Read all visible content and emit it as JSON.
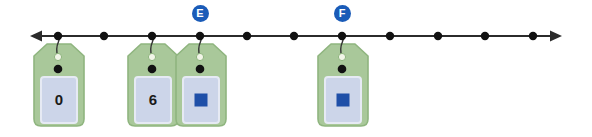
{
  "figure": {
    "background_color": "#ffffff"
  },
  "number_line": {
    "name": "horizontal-number-line",
    "y": 36,
    "x_start": 30,
    "x_end": 562,
    "line_color": "#2b2b2b",
    "line_width": 2.2,
    "arrow_left": true,
    "arrow_right": true,
    "point_color": "#111111",
    "point_radius": 4.2,
    "points": [
      {
        "id": "p1",
        "x": 58,
        "has_tag": true,
        "badge": null
      },
      {
        "id": "p2",
        "x": 104,
        "has_tag": false,
        "badge": null
      },
      {
        "id": "p3",
        "x": 152,
        "has_tag": true,
        "badge": null
      },
      {
        "id": "p4",
        "x": 200,
        "has_tag": true,
        "badge": "E"
      },
      {
        "id": "p5",
        "x": 247,
        "has_tag": false,
        "badge": null
      },
      {
        "id": "p6",
        "x": 294,
        "has_tag": false,
        "badge": null
      },
      {
        "id": "p7",
        "x": 342,
        "has_tag": true,
        "badge": "F"
      },
      {
        "id": "p8",
        "x": 390,
        "has_tag": false,
        "badge": null
      },
      {
        "id": "p9",
        "x": 438,
        "has_tag": false,
        "badge": null
      },
      {
        "id": "p10",
        "x": 485,
        "has_tag": false,
        "badge": null
      },
      {
        "id": "p11",
        "x": 533,
        "has_tag": false,
        "badge": null
      }
    ]
  },
  "badges": [
    {
      "id": "badge-e",
      "label": "E",
      "cx": 200,
      "cy": 13,
      "color": "#1a5bb8",
      "text_color": "#ffffff"
    },
    {
      "id": "badge-f",
      "label": "F",
      "cx": 342,
      "cy": 13,
      "color": "#1a5bb8",
      "text_color": "#ffffff"
    }
  ],
  "tag_style": {
    "body_fill": "#a9c89a",
    "body_stroke": "#8fb57f",
    "panel_fill": "#ccd5e9",
    "panel_stroke": "#e6eaf4",
    "hole_fill": "#f2f5e8",
    "hole_stroke": "#8fb57f",
    "rivet_fill": "#111111",
    "string_color": "#333333",
    "width": 50,
    "height": 82,
    "top_y": 44
  },
  "tags": [
    {
      "id": "tag-0",
      "name": "tag-zero",
      "anchor_x": 58,
      "left": 34,
      "top": 44,
      "content_type": "number",
      "label": "0",
      "square_color": null
    },
    {
      "id": "tag-6",
      "name": "tag-six",
      "anchor_x": 152,
      "left": 128,
      "top": 44,
      "content_type": "number",
      "label": "6",
      "square_color": null
    },
    {
      "id": "tag-e",
      "name": "tag-blue-square-e",
      "anchor_x": 200,
      "left": 176,
      "top": 44,
      "content_type": "square",
      "label": "",
      "square_color": "#1e4fa8"
    },
    {
      "id": "tag-f",
      "name": "tag-blue-square-f",
      "anchor_x": 342,
      "left": 318,
      "top": 44,
      "content_type": "square",
      "label": "",
      "square_color": "#1e4fa8"
    }
  ],
  "colors": {
    "tag_green": "#a9c89a",
    "panel_lavender": "#ccd5e9",
    "badge_blue": "#1a5bb8",
    "square_blue": "#1e4fa8",
    "line_black": "#2b2b2b"
  }
}
